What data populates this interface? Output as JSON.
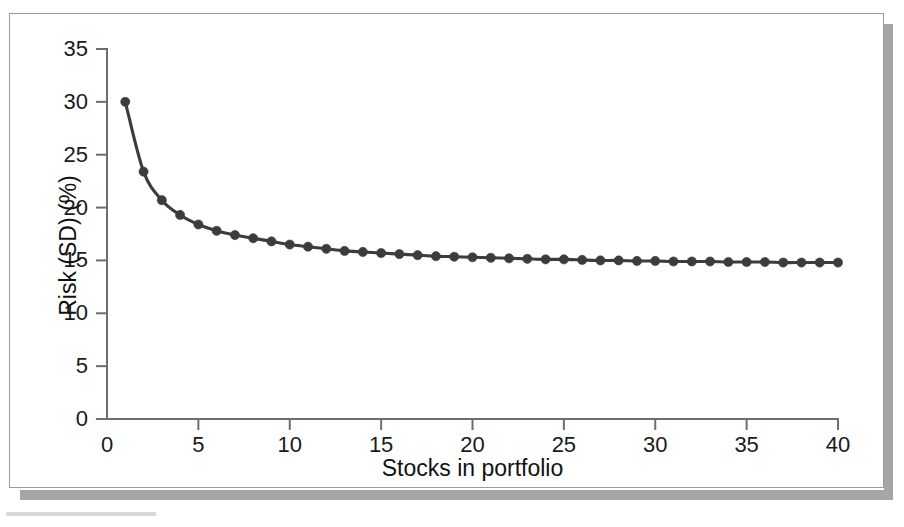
{
  "figure": {
    "background_color": "#ffffff",
    "frame_color": "#9a9a9a",
    "shadow_color": "#a6a6a6",
    "series_color": "#3c3c3c",
    "axis_color": "#6e6e6e"
  },
  "chart_data": {
    "type": "line",
    "title": "",
    "subtitle": "",
    "xlabel": "Stocks in portfolio",
    "ylabel": "Risk (SD) (%)",
    "xlim": [
      0,
      40
    ],
    "ylim": [
      0,
      35
    ],
    "xticks": [
      0,
      5,
      10,
      15,
      20,
      25,
      30,
      35,
      40
    ],
    "xtick_labels": [
      "0",
      "5",
      "10",
      "15",
      "20",
      "25",
      "30",
      "35",
      "40"
    ],
    "yticks": [
      0,
      5,
      10,
      15,
      20,
      25,
      30,
      35
    ],
    "ytick_labels": [
      "0",
      "5",
      "10",
      "15",
      "20",
      "25",
      "30",
      "35"
    ],
    "grid": false,
    "legend": null,
    "legend_position": "none",
    "markers": "filled-circle",
    "annotations": [],
    "series": [
      {
        "name": "Portfolio risk",
        "x": [
          1,
          2,
          3,
          4,
          5,
          6,
          7,
          8,
          9,
          10,
          11,
          12,
          13,
          14,
          15,
          16,
          17,
          18,
          19,
          20,
          21,
          22,
          23,
          24,
          25,
          26,
          27,
          28,
          29,
          30,
          31,
          32,
          33,
          34,
          35,
          36,
          37,
          38,
          39,
          40
        ],
        "values": [
          30.0,
          23.4,
          20.7,
          19.3,
          18.4,
          17.8,
          17.4,
          17.1,
          16.8,
          16.5,
          16.3,
          16.1,
          15.9,
          15.8,
          15.7,
          15.6,
          15.5,
          15.4,
          15.35,
          15.3,
          15.25,
          15.2,
          15.15,
          15.1,
          15.1,
          15.05,
          15.0,
          15.0,
          14.95,
          14.95,
          14.9,
          14.9,
          14.9,
          14.85,
          14.85,
          14.85,
          14.8,
          14.8,
          14.8,
          14.8
        ]
      }
    ]
  }
}
